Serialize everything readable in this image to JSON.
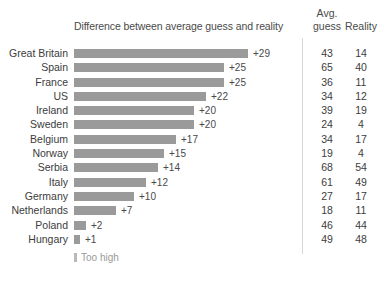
{
  "header": {
    "bar_column_title": "Difference between average guess and reality",
    "avg_line1": "Avg.",
    "avg_line2": "guess",
    "reality": "Reality"
  },
  "legend": {
    "swatch_name": "too-high-swatch",
    "label": "Too high"
  },
  "chart_data": {
    "type": "bar",
    "title": "Difference between average guess and reality",
    "xlabel": "",
    "ylabel": "",
    "orientation": "horizontal",
    "grid": false,
    "legend_position": "bottom-left",
    "legend_entries": [
      "Too high"
    ],
    "xlim": [
      0,
      29
    ],
    "categories": [
      "Great Britain",
      "Spain",
      "France",
      "US",
      "Ireland",
      "Sweden",
      "Belgium",
      "Norway",
      "Serbia",
      "Italy",
      "Germany",
      "Netherlands",
      "Poland",
      "Hungary"
    ],
    "values": [
      29,
      25,
      25,
      22,
      20,
      20,
      17,
      15,
      14,
      12,
      10,
      7,
      2,
      1
    ],
    "value_labels": [
      "+29",
      "+25",
      "+25",
      "+22",
      "+20",
      "+20",
      "+17",
      "+15",
      "+14",
      "+12",
      "+10",
      "+7",
      "+2",
      "+1"
    ],
    "series": [
      {
        "name": "Difference",
        "values": [
          29,
          25,
          25,
          22,
          20,
          20,
          17,
          15,
          14,
          12,
          10,
          7,
          2,
          1
        ]
      },
      {
        "name": "Avg. guess",
        "values": [
          43,
          65,
          36,
          34,
          39,
          24,
          34,
          19,
          68,
          61,
          27,
          18,
          46,
          49
        ]
      },
      {
        "name": "Reality",
        "values": [
          14,
          40,
          11,
          12,
          19,
          4,
          17,
          4,
          54,
          49,
          17,
          11,
          44,
          48
        ]
      }
    ],
    "rows": [
      {
        "country": "Great Britain",
        "diff": 29,
        "diff_label": "+29",
        "avg_guess": "43",
        "reality": "14"
      },
      {
        "country": "Spain",
        "diff": 25,
        "diff_label": "+25",
        "avg_guess": "65",
        "reality": "40"
      },
      {
        "country": "France",
        "diff": 25,
        "diff_label": "+25",
        "avg_guess": "36",
        "reality": "11"
      },
      {
        "country": "US",
        "diff": 22,
        "diff_label": "+22",
        "avg_guess": "34",
        "reality": "12"
      },
      {
        "country": "Ireland",
        "diff": 20,
        "diff_label": "+20",
        "avg_guess": "39",
        "reality": "19"
      },
      {
        "country": "Sweden",
        "diff": 20,
        "diff_label": "+20",
        "avg_guess": "24",
        "reality": "4"
      },
      {
        "country": "Belgium",
        "diff": 17,
        "diff_label": "+17",
        "avg_guess": "34",
        "reality": "17"
      },
      {
        "country": "Norway",
        "diff": 15,
        "diff_label": "+15",
        "avg_guess": "19",
        "reality": "4"
      },
      {
        "country": "Serbia",
        "diff": 14,
        "diff_label": "+14",
        "avg_guess": "68",
        "reality": "54"
      },
      {
        "country": "Italy",
        "diff": 12,
        "diff_label": "+12",
        "avg_guess": "61",
        "reality": "49"
      },
      {
        "country": "Germany",
        "diff": 10,
        "diff_label": "+10",
        "avg_guess": "27",
        "reality": "17"
      },
      {
        "country": "Netherlands",
        "diff": 7,
        "diff_label": "+7",
        "avg_guess": "18",
        "reality": "11"
      },
      {
        "country": "Poland",
        "diff": 2,
        "diff_label": "+2",
        "avg_guess": "46",
        "reality": "44"
      },
      {
        "country": "Hungary",
        "diff": 1,
        "diff_label": "+1",
        "avg_guess": "49",
        "reality": "48"
      }
    ],
    "colors": {
      "bar": "#9a9a9a",
      "text": "#3c3c3c",
      "muted": "#9a9a9a",
      "divider": "#d6d6d6",
      "background": "#ffffff"
    },
    "px_per_unit": 6.0
  }
}
